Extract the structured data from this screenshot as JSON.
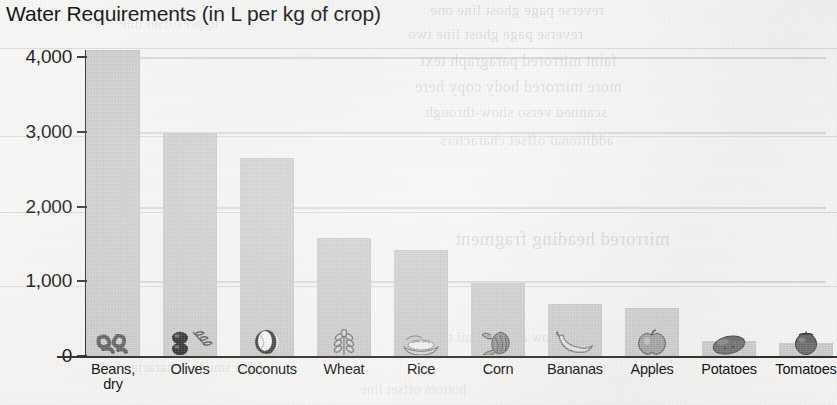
{
  "chart_data": {
    "type": "bar",
    "title": "Water Requirements (in L per kg of crop)",
    "xlabel": "",
    "ylabel": "",
    "ylim": [
      0,
      4230
    ],
    "grid": "horizontal-faint",
    "legend": "none",
    "categories": [
      "Beans, dry",
      "Olives",
      "Coconuts",
      "Wheat",
      "Rice",
      "Corn",
      "Bananas",
      "Apples",
      "Potatoes",
      "Tomatoes"
    ],
    "category_lines": [
      [
        "Beans,",
        "dry"
      ],
      [
        "Olives",
        ""
      ],
      [
        "Coconuts",
        ""
      ],
      [
        "Wheat",
        ""
      ],
      [
        "Rice",
        ""
      ],
      [
        "Corn",
        ""
      ],
      [
        "Bananas",
        ""
      ],
      [
        "Apples",
        ""
      ],
      [
        "Potatoes",
        ""
      ],
      [
        "Tomatoes",
        ""
      ]
    ],
    "values": [
      4100,
      2990,
      2650,
      1580,
      1420,
      980,
      700,
      640,
      200,
      180
    ],
    "icons": [
      "beans-icon",
      "olives-icon",
      "coconut-icon",
      "wheat-icon",
      "rice-icon",
      "corn-icon",
      "banana-icon",
      "apple-icon",
      "potato-icon",
      "tomato-icon"
    ],
    "yticks": [
      0,
      1000,
      2000,
      3000,
      4000
    ],
    "ytick_labels": [
      "0",
      "1,000",
      "2,000",
      "3,000",
      "4,000"
    ],
    "bar_color": "#cacac8",
    "axis_color": "#2e2e2e",
    "text_color": "#141414"
  },
  "page": {
    "background_color": "#f4f4f2",
    "bleed_through_text": [
      "reverse page ghost line one",
      "reverse page ghost line two",
      "faint mirrored paragraph text",
      "more mirrored body copy here",
      "scanned verso show-through",
      "additional offset characters",
      "mirrored heading fragment",
      "low contrast tail text",
      "edge smudge characters",
      "bottom offset line",
      "upper offset line"
    ]
  }
}
